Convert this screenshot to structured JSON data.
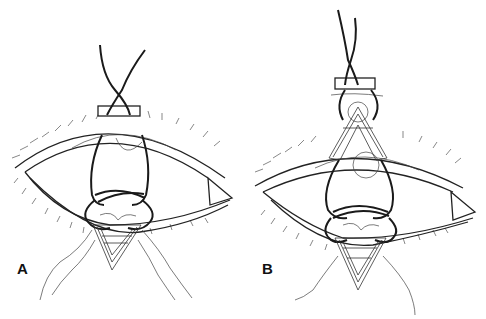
{
  "figure": {
    "panels": [
      {
        "label": "A",
        "description": "Suture passed through bolster above upper lid, loops around globe, tied through triangular tarsal wedge below lower lid"
      },
      {
        "label": "B",
        "description": "Suture with bolster above and triangular tarsal wedges on both upper and lower lids"
      }
    ],
    "colors": {
      "line": "#222222",
      "background": "#ffffff"
    }
  }
}
